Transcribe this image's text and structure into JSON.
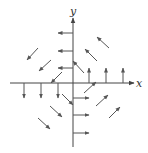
{
  "diagram": {
    "type": "vector-field",
    "colors": {
      "stroke": "#555555",
      "axis": "#444444",
      "label": "#333333",
      "background": "#ffffff"
    },
    "axes": {
      "x": {
        "label": "x",
        "from": [
          10,
          83
        ],
        "to": [
          134,
          83
        ],
        "label_pos": [
          136,
          87
        ]
      },
      "y": {
        "label": "y",
        "from": [
          73,
          147
        ],
        "to": [
          73,
          18
        ],
        "label_pos": [
          70,
          15
        ]
      }
    },
    "arrows": [
      {
        "group": "y-axis-positive",
        "from": [
          73,
          33
        ],
        "to": [
          58,
          33
        ]
      },
      {
        "group": "y-axis-positive",
        "from": [
          73,
          51
        ],
        "to": [
          58,
          51
        ]
      },
      {
        "group": "y-axis-positive",
        "from": [
          73,
          68
        ],
        "to": [
          58,
          68
        ]
      },
      {
        "group": "x-axis-positive",
        "from": [
          89,
          83
        ],
        "to": [
          89,
          68
        ]
      },
      {
        "group": "x-axis-positive",
        "from": [
          106,
          83
        ],
        "to": [
          106,
          68
        ]
      },
      {
        "group": "x-axis-positive",
        "from": [
          123,
          83
        ],
        "to": [
          123,
          68
        ]
      },
      {
        "group": "x-axis-negative",
        "from": [
          24,
          83
        ],
        "to": [
          24,
          98
        ]
      },
      {
        "group": "x-axis-negative",
        "from": [
          41,
          83
        ],
        "to": [
          41,
          98
        ]
      },
      {
        "group": "x-axis-negative",
        "from": [
          58,
          83
        ],
        "to": [
          58,
          98
        ]
      },
      {
        "group": "y-axis-negative",
        "from": [
          73,
          98
        ],
        "to": [
          89,
          98
        ]
      },
      {
        "group": "y-axis-negative",
        "from": [
          73,
          115
        ],
        "to": [
          89,
          115
        ]
      },
      {
        "group": "y-axis-negative",
        "from": [
          73,
          133
        ],
        "to": [
          89,
          133
        ]
      },
      {
        "group": "quadrant-1",
        "from": [
          84,
          73
        ],
        "to": [
          73,
          61
        ]
      },
      {
        "group": "quadrant-1",
        "from": [
          97,
          61
        ],
        "to": [
          85,
          49
        ]
      },
      {
        "group": "quadrant-1",
        "from": [
          109,
          48
        ],
        "to": [
          97,
          37
        ]
      },
      {
        "group": "quadrant-2",
        "from": [
          62,
          72
        ],
        "to": [
          51,
          83
        ]
      },
      {
        "group": "quadrant-2",
        "from": [
          51,
          60
        ],
        "to": [
          39,
          71
        ]
      },
      {
        "group": "quadrant-2",
        "from": [
          38,
          48
        ],
        "to": [
          27,
          60
        ]
      },
      {
        "group": "quadrant-3",
        "from": [
          62,
          94
        ],
        "to": [
          73,
          105
        ]
      },
      {
        "group": "quadrant-3",
        "from": [
          50,
          106
        ],
        "to": [
          62,
          117
        ]
      },
      {
        "group": "quadrant-3",
        "from": [
          38,
          118
        ],
        "to": [
          50,
          129
        ]
      },
      {
        "group": "quadrant-4",
        "from": [
          84,
          93
        ],
        "to": [
          96,
          82
        ]
      },
      {
        "group": "quadrant-4",
        "from": [
          96,
          106
        ],
        "to": [
          108,
          95
        ]
      },
      {
        "group": "quadrant-4",
        "from": [
          109,
          118
        ],
        "to": [
          120,
          107
        ]
      }
    ]
  }
}
